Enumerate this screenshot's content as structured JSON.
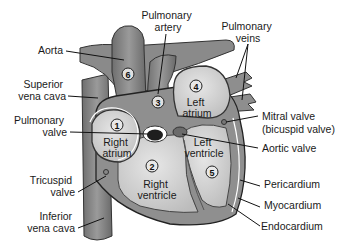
{
  "colors": {
    "vessel": "#7f7f7f",
    "vessel_dark": "#5c5c5c",
    "chamber": "#d6d6d6",
    "muscle": "#9a9a9a",
    "outline": "#3a3a3a",
    "white": "#ffffff"
  },
  "labels": {
    "aorta": "Aorta",
    "superior_vena_cava": [
      "Superior",
      "vena cava"
    ],
    "pulmonary_valve": [
      "Pulmonary",
      "valve"
    ],
    "tricuspid_valve": [
      "Tricuspid",
      "valve"
    ],
    "inferior_vena_cava": [
      "Inferior",
      "vena cava"
    ],
    "pulmonary_artery": [
      "Pulmonary",
      "artery"
    ],
    "pulmonary_veins": [
      "Pulmonary",
      "veins"
    ],
    "mitral_valve": [
      "Mitral valve",
      "(bicuspid valve)"
    ],
    "aortic_valve": "Aortic valve",
    "pericardium": "Pericardium",
    "myocardium": "Myocardium",
    "endocardium": "Endocardium"
  },
  "chambers": {
    "right_atrium": {
      "number": "1",
      "label": [
        "Right",
        "atrium"
      ]
    },
    "right_ventricle": {
      "number": "2",
      "label": [
        "Right",
        "ventricle"
      ]
    },
    "pulmonary_artery": {
      "number": "3"
    },
    "left_atrium": {
      "number": "4",
      "label": [
        "Left",
        "atrium"
      ]
    },
    "left_ventricle": {
      "number": "5",
      "label": [
        "Left",
        "ventricle"
      ]
    },
    "aorta": {
      "number": "6"
    }
  }
}
